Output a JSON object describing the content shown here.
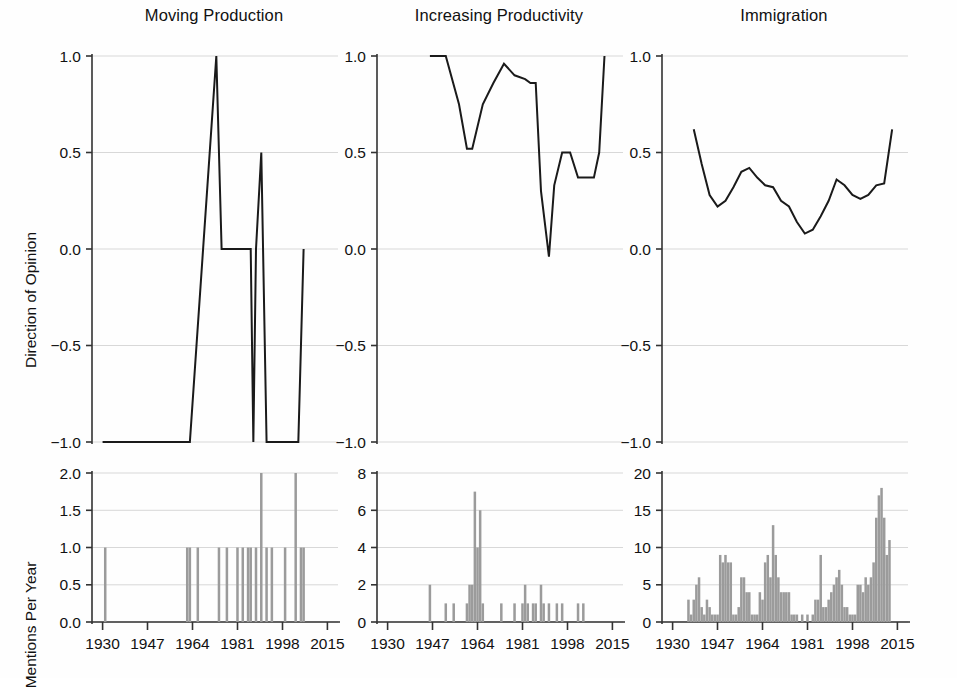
{
  "figure": {
    "background": "#fefefe",
    "line_color": "#1a1a1a",
    "bar_color": "#9b9b9b",
    "grid_color": "#d8d8d8",
    "axis_color": "#333333"
  },
  "axis_labels": {
    "top_row_y": "Direction of Opinion",
    "bottom_row_y": "Mentions Per Year"
  },
  "panels": [
    {
      "key": "moving_production",
      "title": "Moving Production"
    },
    {
      "key": "increasing_productivity",
      "title": "Increasing Productivity"
    },
    {
      "key": "immigration",
      "title": "Immigration"
    }
  ],
  "chart_data": [
    {
      "type": "line",
      "title": "Moving Production",
      "panel": "top-left",
      "xlabel": "",
      "ylabel": "Direction of Opinion",
      "xlim": [
        1926,
        2019
      ],
      "ylim": [
        -1.0,
        1.0
      ],
      "xticks": [
        1930,
        1947,
        1964,
        1981,
        1998,
        2015
      ],
      "xticklabels": [
        "1930",
        "1947",
        "1964",
        "1981",
        "1998",
        "2015"
      ],
      "yticks": [
        -1.0,
        -0.5,
        0.0,
        0.5,
        1.0
      ],
      "yticklabels": [
        "-1.0",
        "-0.5",
        "0.0",
        "0.5",
        "1.0"
      ],
      "grid": true,
      "series": [
        {
          "name": "Direction of Opinion",
          "x": [
            1930,
            1940,
            1950,
            1960,
            1963,
            1973,
            1975,
            1981,
            1986,
            1987,
            1988,
            1990,
            1992,
            1994,
            1999,
            2000,
            2004,
            2006
          ],
          "values": [
            -1.0,
            -1.0,
            -1.0,
            -1.0,
            -1.0,
            1.0,
            0.0,
            0.0,
            0.0,
            -1.0,
            0.0,
            0.5,
            -1.0,
            -1.0,
            -1.0,
            -1.0,
            -1.0,
            0.0
          ]
        }
      ]
    },
    {
      "type": "line",
      "title": "Increasing Productivity",
      "panel": "top-middle",
      "xlabel": "",
      "ylabel": "Direction of Opinion",
      "xlim": [
        1926,
        2019
      ],
      "ylim": [
        -1.0,
        1.0
      ],
      "xticks": [
        1930,
        1947,
        1964,
        1981,
        1998,
        2015
      ],
      "xticklabels": [
        "1930",
        "1947",
        "1964",
        "1981",
        "1998",
        "2015"
      ],
      "yticks": [
        -1.0,
        -0.5,
        0.0,
        0.5,
        1.0
      ],
      "yticklabels": [
        "-1.0",
        "-0.5",
        "0.0",
        "0.5",
        "1.0"
      ],
      "grid": true,
      "series": [
        {
          "name": "Direction of Opinion",
          "x": [
            1946,
            1949,
            1952,
            1957,
            1960,
            1962,
            1966,
            1970,
            1974,
            1978,
            1982,
            1984,
            1986,
            1988,
            1991,
            1993,
            1996,
            1999,
            2002,
            2005,
            2008,
            2010,
            2012
          ],
          "values": [
            1.0,
            1.0,
            1.0,
            0.75,
            0.52,
            0.52,
            0.75,
            0.86,
            0.96,
            0.9,
            0.88,
            0.86,
            0.86,
            0.3,
            -0.04,
            0.33,
            0.5,
            0.5,
            0.37,
            0.37,
            0.37,
            0.5,
            1.0
          ]
        }
      ]
    },
    {
      "type": "line",
      "title": "Immigration",
      "panel": "top-right",
      "xlabel": "",
      "ylabel": "Direction of Opinion",
      "xlim": [
        1926,
        2019
      ],
      "ylim": [
        -1.0,
        1.0
      ],
      "xticks": [
        1930,
        1947,
        1964,
        1981,
        1998,
        2015
      ],
      "xticklabels": [
        "1930",
        "1947",
        "1964",
        "1981",
        "1998",
        "2015"
      ],
      "yticks": [
        -1.0,
        -0.5,
        0.0,
        0.5,
        1.0
      ],
      "yticklabels": [
        "-1.0",
        "-0.5",
        "0.0",
        "0.5",
        "1.0"
      ],
      "grid": true,
      "series": [
        {
          "name": "Direction of Opinion",
          "x": [
            1938,
            1941,
            1944,
            1947,
            1950,
            1953,
            1956,
            1959,
            1962,
            1965,
            1968,
            1971,
            1974,
            1977,
            1980,
            1983,
            1986,
            1989,
            1992,
            1995,
            1998,
            2001,
            2004,
            2007,
            2010,
            2013
          ],
          "values": [
            0.62,
            0.44,
            0.28,
            0.22,
            0.25,
            0.32,
            0.4,
            0.42,
            0.37,
            0.33,
            0.32,
            0.25,
            0.22,
            0.14,
            0.08,
            0.1,
            0.17,
            0.25,
            0.36,
            0.33,
            0.28,
            0.26,
            0.28,
            0.33,
            0.34,
            0.62
          ]
        }
      ]
    },
    {
      "type": "bar",
      "title": "",
      "panel": "bottom-left",
      "xlabel": "",
      "ylabel": "Mentions Per Year",
      "xlim": [
        1926,
        2019
      ],
      "ylim": [
        0,
        2.0
      ],
      "xticks": [
        1930,
        1947,
        1964,
        1981,
        1998,
        2015
      ],
      "xticklabels": [
        "1930",
        "1947",
        "1964",
        "1981",
        "1998",
        "2015"
      ],
      "yticks": [
        0.0,
        0.5,
        1.0,
        1.5,
        2.0
      ],
      "yticklabels": [
        "0.0",
        "0.5",
        "1.0",
        "1.5",
        "2.0"
      ],
      "grid": true,
      "x": [
        1931,
        1962,
        1963,
        1966,
        1974,
        1977,
        1981,
        1983,
        1985,
        1986,
        1988,
        1990,
        1992,
        1994,
        1999,
        2003,
        2005,
        2006
      ],
      "values": [
        1.0,
        1.0,
        1.0,
        1.0,
        1.0,
        1.0,
        1.0,
        1.0,
        1.0,
        1.0,
        1.0,
        2.0,
        1.0,
        1.0,
        1.0,
        2.0,
        1.0,
        1.0
      ]
    },
    {
      "type": "bar",
      "title": "",
      "panel": "bottom-middle",
      "xlabel": "",
      "ylabel": "Mentions Per Year",
      "xlim": [
        1926,
        2019
      ],
      "ylim": [
        0,
        8
      ],
      "xticks": [
        1930,
        1947,
        1964,
        1981,
        1998,
        2015
      ],
      "xticklabels": [
        "1930",
        "1947",
        "1964",
        "1981",
        "1998",
        "2015"
      ],
      "yticks": [
        0,
        2,
        4,
        6,
        8
      ],
      "yticklabels": [
        "0",
        "2",
        "4",
        "6",
        "8"
      ],
      "grid": true,
      "x": [
        1946,
        1952,
        1955,
        1960,
        1961,
        1962,
        1963,
        1964,
        1965,
        1966,
        1973,
        1978,
        1981,
        1982,
        1983,
        1985,
        1986,
        1988,
        1989,
        1991,
        1994,
        1996,
        2002,
        2004
      ],
      "values": [
        2.0,
        1.0,
        1.0,
        1.0,
        2.0,
        2.0,
        7.0,
        4.0,
        6.0,
        1.0,
        1.0,
        1.0,
        1.0,
        2.0,
        1.0,
        1.0,
        1.0,
        2.0,
        1.0,
        1.0,
        1.0,
        1.0,
        1.0,
        1.0
      ]
    },
    {
      "type": "bar",
      "title": "",
      "panel": "bottom-right",
      "xlabel": "",
      "ylabel": "Mentions Per Year",
      "xlim": [
        1926,
        2019
      ],
      "ylim": [
        0,
        20
      ],
      "xticks": [
        1930,
        1947,
        1964,
        1981,
        1998,
        2015
      ],
      "xticklabels": [
        "1930",
        "1947",
        "1964",
        "1981",
        "1998",
        "2015"
      ],
      "yticks": [
        0,
        5,
        10,
        15,
        20
      ],
      "yticklabels": [
        "0",
        "5",
        "10",
        "15",
        "20"
      ],
      "grid": true,
      "x": [
        1936,
        1937,
        1938,
        1939,
        1940,
        1941,
        1942,
        1943,
        1944,
        1945,
        1946,
        1947,
        1948,
        1949,
        1950,
        1951,
        1952,
        1953,
        1954,
        1955,
        1956,
        1957,
        1958,
        1959,
        1960,
        1961,
        1962,
        1963,
        1964,
        1965,
        1966,
        1967,
        1968,
        1969,
        1970,
        1971,
        1972,
        1973,
        1974,
        1975,
        1976,
        1977,
        1979,
        1981,
        1983,
        1984,
        1985,
        1986,
        1987,
        1988,
        1989,
        1990,
        1991,
        1992,
        1993,
        1994,
        1995,
        1996,
        1997,
        1998,
        1999,
        2000,
        2001,
        2002,
        2003,
        2004,
        2005,
        2006,
        2007,
        2008,
        2009,
        2010,
        2011,
        2012
      ],
      "values": [
        3.0,
        1.0,
        3.0,
        5.0,
        6.0,
        2.0,
        1.0,
        3.0,
        2.0,
        1.0,
        1.0,
        1.0,
        9.0,
        8.0,
        9.0,
        8.0,
        8.0,
        1.0,
        1.0,
        2.0,
        6.0,
        6.0,
        4.0,
        4.0,
        1.0,
        1.0,
        1.0,
        4.0,
        3.0,
        8.0,
        9.0,
        6.0,
        13.0,
        9.0,
        6.0,
        4.0,
        4.0,
        4.0,
        4.0,
        1.0,
        1.0,
        1.0,
        1.0,
        1.0,
        1.0,
        3.0,
        3.0,
        9.0,
        2.0,
        2.0,
        3.0,
        4.0,
        5.0,
        6.0,
        7.0,
        5.0,
        2.0,
        2.0,
        1.0,
        1.0,
        1.0,
        5.0,
        5.0,
        4.0,
        6.0,
        5.0,
        6.0,
        8.0,
        14.0,
        17.0,
        18.0,
        14.0,
        9.0,
        11.0,
        9.0,
        1.0
      ]
    }
  ]
}
